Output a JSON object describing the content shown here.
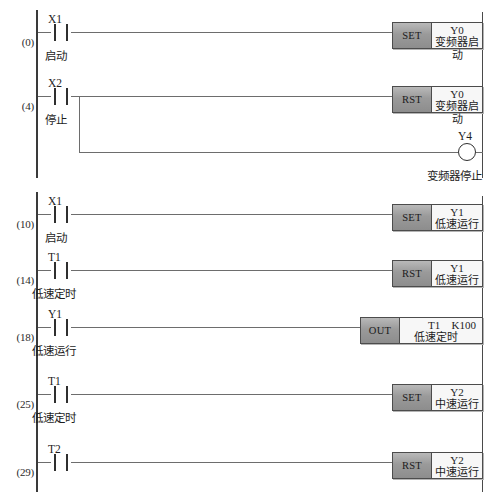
{
  "diagram": {
    "kind": "plc-ladder-logic",
    "rails": {
      "left_label": "left-power-rail",
      "right_label": "right-power-rail"
    },
    "rungs": [
      {
        "step": "(0)",
        "contact": {
          "device": "X1",
          "comment": "启动",
          "type": "no"
        },
        "output": {
          "kind": "block",
          "op": "SET",
          "device": "Y0",
          "comment": "变频器启动"
        }
      },
      {
        "step": "(4)",
        "contact": {
          "device": "X2",
          "comment": "停止",
          "type": "no"
        },
        "output": {
          "kind": "block",
          "op": "RST",
          "device": "Y0",
          "comment": "变频器启动"
        },
        "branch": {
          "kind": "coil",
          "device": "Y4",
          "comment": "变频器停止"
        }
      },
      {
        "step": "(10)",
        "contact": {
          "device": "X1",
          "comment": "启动",
          "type": "no"
        },
        "output": {
          "kind": "block",
          "op": "SET",
          "device": "Y1",
          "comment": "低速运行"
        }
      },
      {
        "step": "(14)",
        "contact": {
          "device": "T1",
          "comment": "低速定时",
          "type": "no"
        },
        "output": {
          "kind": "block",
          "op": "RST",
          "device": "Y1",
          "comment": "低速运行"
        }
      },
      {
        "step": "(18)",
        "contact": {
          "device": "Y1",
          "comment": "低速运行",
          "type": "no"
        },
        "output": {
          "kind": "block",
          "op": "OUT",
          "device": "T1",
          "comment": "低速定时",
          "preset": "K100"
        }
      },
      {
        "step": "(25)",
        "contact": {
          "device": "T1",
          "comment": "低速定时",
          "type": "no"
        },
        "output": {
          "kind": "block",
          "op": "SET",
          "device": "Y2",
          "comment": "中速运行"
        }
      },
      {
        "step": "(29)",
        "contact": {
          "device": "T2",
          "comment": "",
          "type": "no"
        },
        "output": {
          "kind": "block",
          "op": "RST",
          "device": "Y2",
          "comment": "中速运行"
        }
      }
    ]
  },
  "colors": {
    "rail": "#3a3a3a",
    "wire": "#6d6d6d",
    "block_border": "#4c4c4c",
    "op_fill": "#9a9a9a",
    "body_fill": "#f7f7f7",
    "text": "#1d1d1d"
  }
}
